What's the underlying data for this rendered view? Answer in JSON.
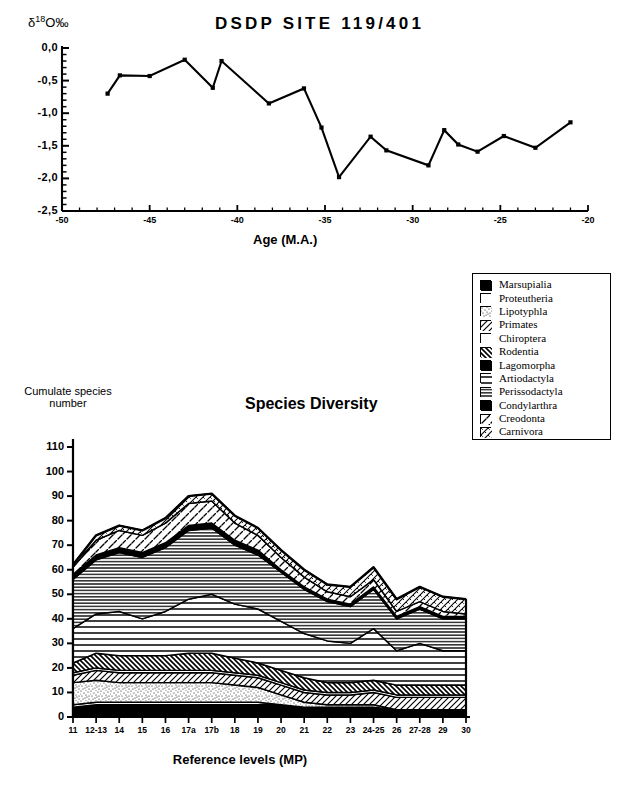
{
  "figure": {
    "background": "#ffffff",
    "ink": "#000000"
  },
  "isotope_chart": {
    "title": "DSDP  SITE  119/401",
    "ylabel_delta": "δ",
    "ylabel_sup": "18",
    "ylabel_rest": "O‰",
    "xlabel": "Age (M.A.)",
    "yticks": [
      "0,0",
      "-0,5",
      "-1,0",
      "-1,5",
      "-2,0",
      "-2,5"
    ],
    "xticks": [
      "-50",
      "-45",
      "-40",
      "-35",
      "-30",
      "-25",
      "-20"
    ]
  },
  "legend": {
    "items": [
      {
        "label": "Marsupialia",
        "pattern": "solid-black"
      },
      {
        "label": "Proteutheria",
        "pattern": "empty-white"
      },
      {
        "label": "Lipotyphla",
        "pattern": "stipple-dense"
      },
      {
        "label": "Primates",
        "pattern": "diag-hatch-left"
      },
      {
        "label": "Chiroptera",
        "pattern": "empty-white"
      },
      {
        "label": "Rodentia",
        "pattern": "diag-hatch-right-heavy"
      },
      {
        "label": "Lagomorpha",
        "pattern": "solid-black"
      },
      {
        "label": "Artiodactyla",
        "pattern": "horiz-lines-wide"
      },
      {
        "label": "Perissodactyla",
        "pattern": "horiz-lines-dense"
      },
      {
        "label": "Condylarthra",
        "pattern": "solid-black"
      },
      {
        "label": "Creodonta",
        "pattern": "diag-hatch-sparse"
      },
      {
        "label": "Carnivora",
        "pattern": "diag-hatch-cross"
      }
    ]
  },
  "diversity_chart": {
    "title": "Species Diversity",
    "ylabel_line1": "Cumulate species",
    "ylabel_line2": "number",
    "xlabel": "Reference levels (MP)",
    "yticks": [
      "110",
      "100",
      "90",
      "80",
      "70",
      "60",
      "50",
      "40",
      "30",
      "20",
      "10",
      "0"
    ]
  },
  "chart_data": [
    {
      "type": "line",
      "title": "DSDP  SITE  119/401",
      "xlabel": "Age (M.A.)",
      "ylabel": "δ18O‰",
      "xlim": [
        -50,
        -20
      ],
      "ylim": [
        -2.5,
        0.0
      ],
      "grid": false,
      "legend": "none",
      "marker": "square",
      "x": [
        -47.4,
        -46.7,
        -45.0,
        -43.0,
        -41.4,
        -40.9,
        -38.2,
        -36.2,
        -35.2,
        -34.2,
        -32.4,
        -31.5,
        -29.1,
        -28.2,
        -27.4,
        -26.3,
        -24.8,
        -23.0,
        -21.0
      ],
      "y": [
        -0.7,
        -0.42,
        -0.43,
        -0.18,
        -0.61,
        -0.2,
        -0.85,
        -0.62,
        -1.22,
        -1.98,
        -1.36,
        -1.57,
        -1.8,
        -1.26,
        -1.48,
        -1.59,
        -1.35,
        -1.53,
        -1.14
      ]
    },
    {
      "type": "area",
      "stacked": true,
      "title": "Species Diversity",
      "xlabel": "Reference levels (MP)",
      "ylabel": "Cumulate species number",
      "ylim": [
        0,
        110
      ],
      "grid": false,
      "legend": "top-right-box",
      "categories": [
        "11",
        "12-13",
        "14",
        "15",
        "16",
        "17a",
        "17b",
        "18",
        "19",
        "20",
        "21",
        "22",
        "23",
        "24-25",
        "26",
        "27-28",
        "29",
        "30"
      ],
      "series": [
        {
          "name": "Marsupialia",
          "pattern": "solid-black",
          "values": [
            4,
            5,
            5,
            5,
            5,
            5,
            5,
            5,
            5,
            5,
            4,
            4,
            4,
            4,
            3,
            3,
            3,
            3
          ]
        },
        {
          "name": "Proteutheria",
          "pattern": "empty-white",
          "values": [
            1,
            1,
            1,
            1,
            1,
            1,
            1,
            1,
            1,
            0,
            0,
            0,
            0,
            0,
            0,
            0,
            0,
            0
          ]
        },
        {
          "name": "Lipotyphla",
          "pattern": "stipple-dense",
          "values": [
            9,
            9,
            8,
            8,
            8,
            8,
            8,
            7,
            6,
            4,
            2,
            1,
            1,
            1,
            0,
            0,
            0,
            0
          ]
        },
        {
          "name": "Primates",
          "pattern": "diag-hatch-left",
          "values": [
            3,
            4,
            4,
            4,
            4,
            4,
            4,
            4,
            4,
            4,
            4,
            4,
            4,
            5,
            5,
            5,
            5,
            5
          ]
        },
        {
          "name": "Chiroptera",
          "pattern": "empty-white",
          "values": [
            1,
            1,
            1,
            1,
            1,
            1,
            1,
            1,
            1,
            1,
            1,
            1,
            1,
            1,
            1,
            1,
            1,
            1
          ]
        },
        {
          "name": "Rodentia",
          "pattern": "diag-hatch-right-heavy",
          "values": [
            4,
            6,
            6,
            6,
            6,
            7,
            7,
            6,
            5,
            5,
            5,
            4,
            4,
            4,
            4,
            4,
            4,
            4
          ]
        },
        {
          "name": "Lagomorpha",
          "pattern": "solid-black",
          "values": [
            0,
            0,
            0,
            0,
            0,
            0,
            0,
            0,
            0,
            0,
            0,
            0,
            0,
            0,
            0,
            0,
            0,
            0
          ]
        },
        {
          "name": "Artiodactyla",
          "pattern": "horiz-lines-wide",
          "values": [
            14,
            16,
            18,
            15,
            18,
            22,
            24,
            22,
            22,
            20,
            18,
            17,
            16,
            21,
            14,
            17,
            14,
            14
          ]
        },
        {
          "name": "Perissodactyla",
          "pattern": "horiz-lines-dense",
          "values": [
            20,
            22,
            24,
            25,
            26,
            28,
            27,
            24,
            22,
            20,
            18,
            16,
            15,
            16,
            13,
            14,
            13,
            13
          ]
        },
        {
          "name": "Condylarthra",
          "pattern": "solid-black",
          "values": [
            2,
            2,
            2,
            2,
            2,
            2,
            2,
            2,
            2,
            1,
            1,
            1,
            1,
            1,
            1,
            1,
            1,
            1
          ]
        },
        {
          "name": "Creodonta",
          "pattern": "diag-hatch-sparse",
          "values": [
            3,
            6,
            7,
            7,
            8,
            9,
            9,
            7,
            6,
            5,
            4,
            3,
            3,
            3,
            2,
            2,
            2,
            1
          ]
        },
        {
          "name": "Carnivora",
          "pattern": "diag-hatch-cross",
          "values": [
            1,
            2,
            2,
            2,
            2,
            3,
            3,
            3,
            3,
            3,
            3,
            3,
            4,
            5,
            5,
            6,
            6,
            6
          ]
        }
      ],
      "totals": [
        62,
        74,
        78,
        76,
        81,
        90,
        91,
        82,
        77,
        68,
        60,
        54,
        53,
        61,
        48,
        53,
        49,
        48
      ]
    }
  ]
}
